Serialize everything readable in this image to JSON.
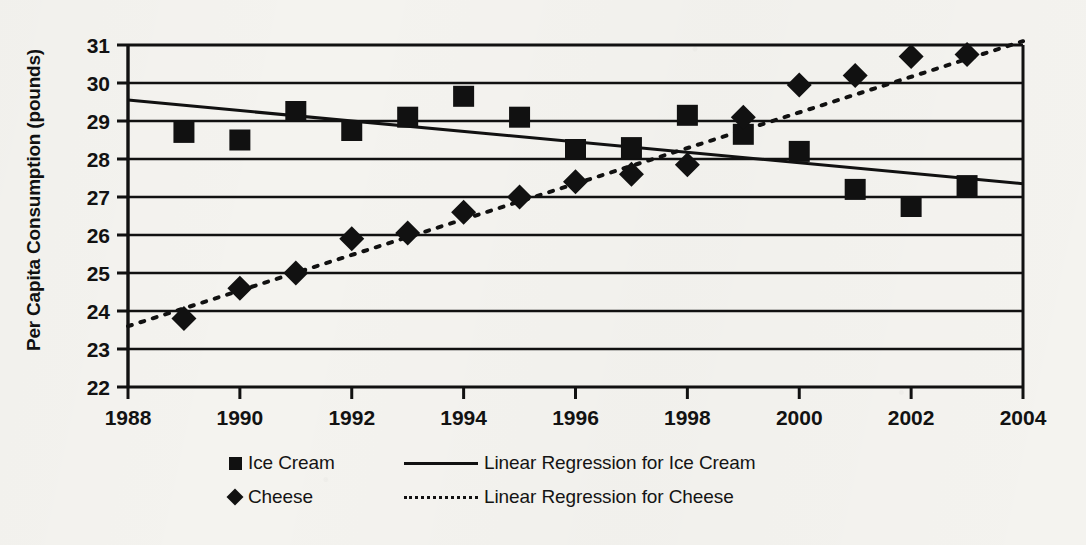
{
  "chart_data": {
    "type": "scatter",
    "title": "",
    "xlabel": "",
    "ylabel": "Per Capita Consumption (pounds)",
    "xlim": [
      1988,
      2004
    ],
    "ylim": [
      22,
      31
    ],
    "xticks": [
      1988,
      1990,
      1992,
      1994,
      1996,
      1998,
      2000,
      2002,
      2004
    ],
    "yticks": [
      22,
      23,
      24,
      25,
      26,
      27,
      28,
      29,
      30,
      31
    ],
    "grid": "horizontal",
    "legend_position": "bottom",
    "x": [
      1989,
      1990,
      1991,
      1992,
      1993,
      1994,
      1995,
      1996,
      1997,
      1998,
      1999,
      2000,
      2001,
      2002,
      2003
    ],
    "series": [
      {
        "name": "Ice Cream",
        "marker": "square",
        "values": [
          28.7,
          28.5,
          29.25,
          28.75,
          29.1,
          29.65,
          29.1,
          28.25,
          28.3,
          29.15,
          28.65,
          28.2,
          27.2,
          26.75,
          27.3
        ]
      },
      {
        "name": "Cheese",
        "marker": "diamond",
        "values": [
          23.8,
          24.6,
          25.0,
          25.9,
          26.05,
          26.6,
          27.0,
          27.4,
          27.6,
          27.85,
          29.1,
          29.95,
          30.2,
          30.7,
          30.75
        ]
      }
    ],
    "trendlines": [
      {
        "name": "Linear Regression for Ice Cream",
        "style": "solid",
        "x": [
          1988,
          2004
        ],
        "y": [
          29.55,
          27.35
        ]
      },
      {
        "name": "Linear Regression for Cheese",
        "style": "dotted",
        "x": [
          1988,
          2004
        ],
        "y": [
          23.6,
          31.1
        ]
      }
    ]
  },
  "legend": {
    "rows": [
      {
        "marker": "square-marker",
        "label": "Ice Cream",
        "line_style": "solid-line",
        "line_label": "Linear Regression for Ice Cream"
      },
      {
        "marker": "diamond-marker",
        "label": "Cheese",
        "line_style": "dotted-line",
        "line_label": "Linear Regression for Cheese"
      }
    ]
  },
  "colors": {
    "ink": "#111111",
    "paper": "#f4f3ef"
  }
}
